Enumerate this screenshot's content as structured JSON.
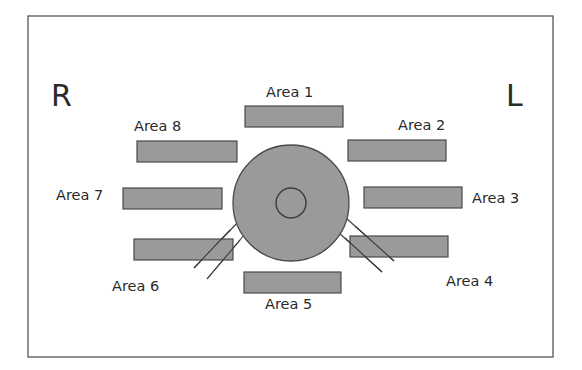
{
  "diagram": {
    "side_labels": {
      "left": "R",
      "right": "L"
    },
    "areas": [
      {
        "id": 1,
        "label": "Area 1"
      },
      {
        "id": 2,
        "label": "Area 2"
      },
      {
        "id": 3,
        "label": "Area 3"
      },
      {
        "id": 4,
        "label": "Area 4"
      },
      {
        "id": 5,
        "label": "Area 5"
      },
      {
        "id": 6,
        "label": "Area 6"
      },
      {
        "id": 7,
        "label": "Area 7"
      },
      {
        "id": 8,
        "label": "Area 8"
      }
    ],
    "colors": {
      "fill": "#9a9a9a",
      "stroke": "#4a4a4a",
      "text": "#2a2a2a",
      "frame": "#555555"
    }
  }
}
